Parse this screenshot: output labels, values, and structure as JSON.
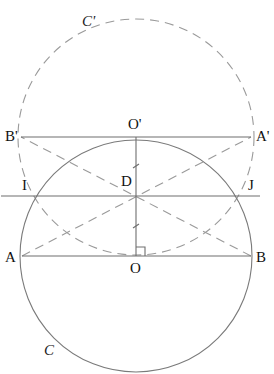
{
  "figure": {
    "width": 274,
    "height": 374,
    "background": "#ffffff",
    "stroke_color": "#7a7a7a",
    "dash_color": "#9a9a9a"
  },
  "circles": {
    "C": {
      "label": "C",
      "center": "O",
      "cx": 136,
      "cy": 256,
      "r": 116,
      "style": "solid"
    },
    "C_prime": {
      "label": "C'",
      "center": "O'",
      "cx": 136,
      "cy": 137,
      "r": 118,
      "style": "dashed"
    }
  },
  "points": {
    "A": {
      "label": "A",
      "x": 22,
      "y": 256
    },
    "B": {
      "label": "B",
      "x": 251,
      "y": 256
    },
    "O": {
      "label": "O",
      "x": 136,
      "y": 256
    },
    "A_prime": {
      "label": "A'",
      "x": 251,
      "y": 137
    },
    "B_prime": {
      "label": "B'",
      "x": 21,
      "y": 137
    },
    "O_prime": {
      "label": "O'",
      "x": 136,
      "y": 137
    },
    "D": {
      "label": "D",
      "x": 136,
      "y": 196
    },
    "I": {
      "label": "I",
      "x": 36,
      "y": 196
    },
    "J": {
      "label": "J",
      "x": 236,
      "y": 196
    }
  },
  "segments": [
    {
      "name": "AB",
      "from": "A",
      "to": "B",
      "style": "solid"
    },
    {
      "name": "B'A'",
      "from": "B_prime",
      "to": "A_prime",
      "style": "solid"
    },
    {
      "name": "OO'",
      "from": "O",
      "to": "O_prime",
      "style": "solid"
    },
    {
      "name": "IJ-line",
      "from": "I",
      "to": "J",
      "style": "solid",
      "extended": true
    },
    {
      "name": "AA'",
      "from": "A",
      "to": "A_prime",
      "style": "dashed"
    },
    {
      "name": "BB'",
      "from": "B",
      "to": "B_prime",
      "style": "dashed"
    }
  ],
  "annotations": {
    "right_angle_at": "O",
    "tick_marks_on": "OO'"
  },
  "labels": {
    "C": "C",
    "C_prime": "C'",
    "A": "A",
    "B": "B",
    "O": "O",
    "A_prime": "A'",
    "B_prime": "B'",
    "O_prime": "O'",
    "D": "D",
    "I": "I",
    "J": "J"
  }
}
